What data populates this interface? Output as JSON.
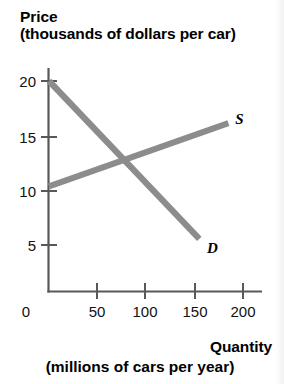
{
  "chart_data": {
    "type": "line",
    "title": "Price (thousands of dollars per car)",
    "ylabel_line1": "Price",
    "ylabel_line2": "(thousands of dollars per car)",
    "xlabel_line1": "Quantity",
    "xlabel_line2": "(millions of cars per year)",
    "xlim": [
      0,
      212
    ],
    "ylim": [
      0,
      22
    ],
    "grid": false,
    "legend_position": "inline-curve-end",
    "origin_label": "0",
    "yticks": [
      5,
      10,
      15,
      20
    ],
    "ytick_labels": [
      "5",
      "10",
      "15",
      "20"
    ],
    "xticks": [
      50,
      100,
      150,
      200
    ],
    "xtick_labels": [
      "50",
      "100",
      "150",
      "200"
    ],
    "series": [
      {
        "name": "S",
        "label": "S",
        "description": "supply curve",
        "color": "#8c8c8c",
        "x": [
          0,
          185
        ],
        "y": [
          10,
          16
        ],
        "label_x": 192,
        "label_y": 16.4
      },
      {
        "name": "D",
        "label": "D",
        "description": "demand curve",
        "color": "#8c8c8c",
        "x": [
          0,
          155
        ],
        "y": [
          20,
          5
        ],
        "label_x": 163,
        "label_y": 4.1
      }
    ],
    "equilibrium": {
      "quantity": 72,
      "price": 12.5
    },
    "colors": {
      "curve": "#8c8c8c",
      "axis": "#58585a",
      "text": "#000000",
      "background": "#ffffff"
    }
  }
}
